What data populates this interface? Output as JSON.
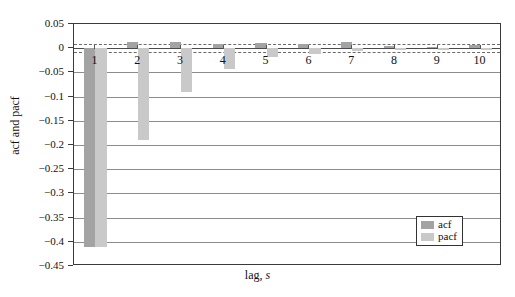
{
  "chart_data": {
    "type": "bar",
    "title": "",
    "xlabel": "lag, s",
    "ylabel": "acf and pacf",
    "categories": [
      1,
      2,
      3,
      4,
      5,
      6,
      7,
      8,
      9,
      10
    ],
    "xtick_labels": [
      "1",
      "2",
      "3",
      "4",
      "5",
      "6",
      "7",
      "8",
      "9",
      "10"
    ],
    "ylim": [
      -0.45,
      0.05
    ],
    "ytick_labels": [
      "0.05",
      "0",
      "-0.05",
      "-0.1",
      "-0.15",
      "-0.2",
      "-0.25",
      "-0.3",
      "-0.35",
      "-0.4",
      "-0.45"
    ],
    "ytick_values": [
      0.05,
      0,
      -0.05,
      -0.1,
      -0.15,
      -0.2,
      -0.25,
      -0.3,
      -0.35,
      -0.4,
      -0.45
    ],
    "grid": true,
    "legend_position": "bottom-right",
    "series": [
      {
        "name": "acf",
        "color": "#a3a3a3",
        "values": [
          -0.41,
          0.012,
          0.012,
          0.008,
          0.011,
          0.009,
          0.013,
          0.004,
          0.003,
          0.006
        ]
      },
      {
        "name": "pacf",
        "color": "#c9c9c9",
        "values": [
          -0.41,
          -0.19,
          -0.09,
          -0.042,
          -0.018,
          -0.012,
          -0.006,
          -0.004,
          -0.003,
          -0.003
        ]
      }
    ],
    "confidence_bands": {
      "upper": 0.008,
      "lower": -0.008,
      "style": "dashed"
    }
  },
  "legend": {
    "items": [
      {
        "label": "acf"
      },
      {
        "label": "pacf"
      }
    ]
  }
}
